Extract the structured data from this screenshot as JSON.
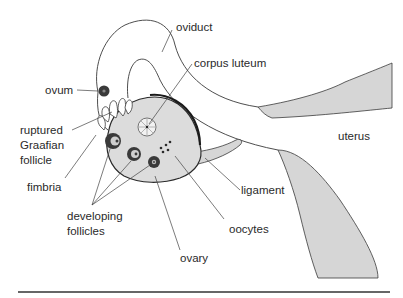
{
  "diagram": {
    "labels": {
      "oviduct": "oviduct",
      "corpus_luteum": "corpus luteum",
      "ovum": "ovum",
      "ruptured_graafian_follicle_line1": "ruptured",
      "ruptured_graafian_follicle_line2": "Graafian",
      "ruptured_graafian_follicle_line3": "follicle",
      "uterus": "uterus",
      "fimbria": "fimbria",
      "ligament": "ligament",
      "developing_follicles_line1": "developing",
      "developing_follicles_line2": "follicles",
      "oocytes": "oocytes",
      "ovary": "ovary"
    },
    "colors": {
      "tissue_fill": "#d6d6d6",
      "ovary_fill": "#dcdcdc",
      "outline": "#3a3a3a",
      "follicle": "#3c3c3c",
      "rule": "#333333"
    }
  }
}
